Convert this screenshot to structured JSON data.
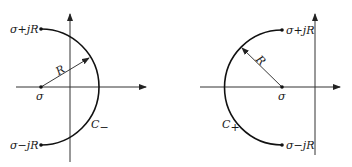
{
  "diagrams": [
    {
      "id": "left",
      "contour_label": "C",
      "contour_subscript": "−",
      "radius_label": "R",
      "center_label": "σ",
      "top_point_label": "σ+jR",
      "bottom_point_label": "σ−jR",
      "arc_direction": "right"
    },
    {
      "id": "right",
      "contour_label": "C",
      "contour_subscript": "+",
      "radius_label": "R",
      "center_label": "σ",
      "top_point_label": "σ+jR",
      "bottom_point_label": "σ−jR",
      "arc_direction": "left"
    }
  ]
}
